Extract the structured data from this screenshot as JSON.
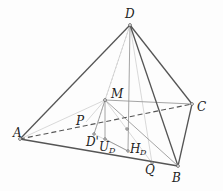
{
  "diagram": {
    "type": "pyramid-geometry",
    "points": {
      "D": {
        "label": "D",
        "x": 130,
        "y": 25
      },
      "A": {
        "label": "A",
        "x": 20,
        "y": 139
      },
      "B": {
        "label": "B",
        "x": 178,
        "y": 166
      },
      "C": {
        "label": "C",
        "x": 192,
        "y": 104
      },
      "M": {
        "label": "M",
        "x": 105,
        "y": 100
      },
      "P": {
        "label": "P",
        "x": 86,
        "y": 122
      },
      "Dp": {
        "label": "D'",
        "x": 94,
        "y": 134
      },
      "UD": {
        "label": "U",
        "sub": "D",
        "x": 105,
        "y": 139
      },
      "HD": {
        "label": "H",
        "sub": "D",
        "x": 128,
        "y": 151
      },
      "Q": {
        "label": "Q",
        "x": 152,
        "y": 163
      }
    },
    "colors": {
      "edge": "#555555",
      "thin": "#9a9a9a",
      "faint": "#c4c4c4",
      "label": "#222222"
    }
  }
}
